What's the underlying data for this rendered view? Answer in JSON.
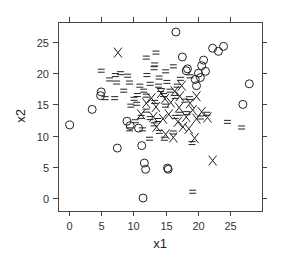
{
  "chart_data": {
    "type": "scatter",
    "title": "",
    "xlabel": "x1",
    "ylabel": "x2",
    "xlim": [
      -1.7,
      30
    ],
    "ylim": [
      -2,
      28.3
    ],
    "xticks": [
      0,
      5,
      10,
      15,
      20,
      25
    ],
    "yticks": [
      0,
      5,
      10,
      15,
      20,
      25
    ],
    "xtick_labels": [
      "0",
      "5",
      "10",
      "15",
      "20",
      "25"
    ],
    "ytick_labels": [
      "0",
      "5",
      "10",
      "15",
      "20",
      "25"
    ],
    "grid": false,
    "legend": null,
    "ticks_on_all_sides": true,
    "series": [
      {
        "name": "O",
        "marker": "circle",
        "points": [
          [
            0.1,
            11.7
          ],
          [
            3.6,
            14.2
          ],
          [
            4.9,
            16.4
          ],
          [
            5.0,
            17.0
          ],
          [
            7.5,
            8.0
          ],
          [
            9.0,
            12.3
          ],
          [
            9.5,
            11.6
          ],
          [
            11.3,
            8.4
          ],
          [
            11.7,
            5.6
          ],
          [
            11.9,
            4.6
          ],
          [
            11.5,
            0.0
          ],
          [
            15.3,
            4.8
          ],
          [
            15.4,
            4.6
          ],
          [
            16.6,
            26.6
          ],
          [
            17.6,
            22.6
          ],
          [
            18.2,
            20.4
          ],
          [
            18.4,
            20.7
          ],
          [
            19.8,
            18.0
          ],
          [
            19.6,
            19.0
          ],
          [
            20.1,
            20.0
          ],
          [
            20.4,
            19.3
          ],
          [
            20.6,
            21.2
          ],
          [
            20.9,
            22.1
          ],
          [
            21.2,
            20.3
          ],
          [
            22.3,
            24.0
          ],
          [
            23.2,
            23.5
          ],
          [
            24.0,
            24.3
          ],
          [
            27.0,
            15.0
          ],
          [
            28.0,
            18.3
          ],
          [
            10.8,
            11.2
          ]
        ]
      },
      {
        "name": "=",
        "marker": "equals",
        "points": [
          [
            5.0,
            20.4
          ],
          [
            6.3,
            19.0
          ],
          [
            7.2,
            19.7
          ],
          [
            5.6,
            16.0
          ],
          [
            7.4,
            18.5
          ],
          [
            7.1,
            16.0
          ],
          [
            8.5,
            17.2
          ],
          [
            8.0,
            20.0
          ],
          [
            9.1,
            19.6
          ],
          [
            9.4,
            18.5
          ],
          [
            10.6,
            16.5
          ],
          [
            11.0,
            18.0
          ],
          [
            11.6,
            17.2
          ],
          [
            10.5,
            15.1
          ],
          [
            9.6,
            14.8
          ],
          [
            12.1,
            19.7
          ],
          [
            13.2,
            20.8
          ],
          [
            13.3,
            21.4
          ],
          [
            14.0,
            19.3
          ],
          [
            12.6,
            18.3
          ],
          [
            13.9,
            18.0
          ],
          [
            14.2,
            17.3
          ],
          [
            15.2,
            18.6
          ],
          [
            15.7,
            17.2
          ],
          [
            16.5,
            16.2
          ],
          [
            16.8,
            18.0
          ],
          [
            18.7,
            16.0
          ],
          [
            18.0,
            15.6
          ],
          [
            12.0,
            14.0
          ],
          [
            11.2,
            13.0
          ],
          [
            12.6,
            12.8
          ],
          [
            10.3,
            12.3
          ],
          [
            11.4,
            11.0
          ],
          [
            13.2,
            11.8
          ],
          [
            14.0,
            10.6
          ],
          [
            12.5,
            9.5
          ],
          [
            14.8,
            9.5
          ],
          [
            16.2,
            10.5
          ],
          [
            17.2,
            13.5
          ],
          [
            18.3,
            13.6
          ],
          [
            15.0,
            14.8
          ],
          [
            16.5,
            13.0
          ],
          [
            19.1,
            8.8
          ],
          [
            20.4,
            12.9
          ],
          [
            21.4,
            13.5
          ],
          [
            24.6,
            12.2
          ],
          [
            26.8,
            11.3
          ],
          [
            19.2,
            1.0
          ],
          [
            13.3,
            15.4
          ],
          [
            10.1,
            15.9
          ],
          [
            12.0,
            22.5
          ],
          [
            13.5,
            23.3
          ],
          [
            15.0,
            20.3
          ],
          [
            16.2,
            21.1
          ],
          [
            17.3,
            19.1
          ],
          [
            9.4,
            11.0
          ],
          [
            13.8,
            12.5
          ],
          [
            12.0,
            16.4
          ],
          [
            14.7,
            16.5
          ],
          [
            18.8,
            19.5
          ]
        ]
      },
      {
        "name": "X",
        "marker": "cross",
        "points": [
          [
            7.6,
            23.3
          ],
          [
            12.0,
            15.2
          ],
          [
            12.8,
            16.0
          ],
          [
            13.5,
            14.6
          ],
          [
            14.3,
            16.8
          ],
          [
            14.9,
            15.9
          ],
          [
            15.8,
            15.3
          ],
          [
            16.4,
            17.1
          ],
          [
            17.2,
            16.3
          ],
          [
            15.5,
            13.4
          ],
          [
            14.6,
            12.7
          ],
          [
            13.1,
            13.0
          ],
          [
            16.9,
            12.2
          ],
          [
            17.7,
            11.4
          ],
          [
            18.6,
            11.1
          ],
          [
            19.5,
            9.6
          ],
          [
            19.8,
            12.7
          ],
          [
            20.6,
            13.8
          ],
          [
            21.5,
            12.9
          ],
          [
            22.3,
            6.0
          ],
          [
            17.1,
            14.5
          ],
          [
            18.8,
            15.2
          ],
          [
            15.0,
            10.2
          ],
          [
            13.6,
            11.4
          ],
          [
            16.2,
            9.7
          ],
          [
            18.2,
            13.0
          ],
          [
            19.2,
            14.1
          ],
          [
            11.2,
            13.4
          ],
          [
            17.5,
            18.0
          ],
          [
            19.8,
            16.3
          ]
        ]
      }
    ]
  },
  "plot_area": {
    "left": 58,
    "top": 22,
    "right": 262,
    "bottom": 211
  },
  "colors": {
    "ink": "#222222",
    "frame": "#444444",
    "background": "#ffffff"
  }
}
